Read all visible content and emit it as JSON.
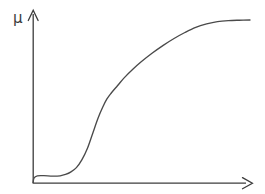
{
  "figure": {
    "name": "membership-function-plot",
    "background_color": "#ffffff",
    "width": 265,
    "height": 194
  },
  "axes": {
    "y_axis": {
      "label": "μ",
      "label_name": "mu",
      "arrow": "up",
      "arrow_icon": "arrow-up-icon",
      "color": "#3c3c3c",
      "x_px": 33,
      "top_px": 12,
      "bottom_px": 183
    },
    "x_axis": {
      "label": "",
      "arrow": "right",
      "arrow_icon": "arrow-right-icon",
      "color": "#3c3c3c",
      "y_px": 183,
      "left_px": 33,
      "right_px": 250
    },
    "grid": "off",
    "tick_labels": [],
    "legend": "none"
  },
  "chart_data": {
    "type": "line",
    "title": "",
    "subtitle": "",
    "xlabel": "",
    "ylabel": "μ",
    "grid": false,
    "legend_position": "none",
    "xlim": [
      0,
      1
    ],
    "ylim": [
      0,
      1
    ],
    "axis_tick_labels": {
      "x": [],
      "y": []
    },
    "annotations": [],
    "series": [
      {
        "name": "membership-curve",
        "color": "#4a4a4a",
        "shape": "sigmoid",
        "x": [
          0.0,
          0.005,
          0.02,
          0.05,
          0.09,
          0.125,
          0.15,
          0.175,
          0.2,
          0.225,
          0.25,
          0.275,
          0.3,
          0.32,
          0.34,
          0.36,
          0.39,
          0.42,
          0.46,
          0.5,
          0.55,
          0.6,
          0.65,
          0.7,
          0.75,
          0.8,
          0.85,
          0.9,
          0.95,
          1.0
        ],
        "y": [
          0.0,
          0.03,
          0.042,
          0.043,
          0.04,
          0.042,
          0.05,
          0.065,
          0.09,
          0.135,
          0.2,
          0.29,
          0.38,
          0.44,
          0.49,
          0.525,
          0.57,
          0.615,
          0.665,
          0.71,
          0.76,
          0.805,
          0.845,
          0.88,
          0.91,
          0.93,
          0.944,
          0.95,
          0.952,
          0.953
        ]
      }
    ]
  }
}
